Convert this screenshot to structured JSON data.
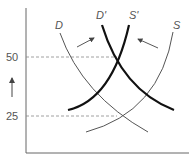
{
  "diagram": {
    "type": "supply-demand-shift",
    "y_ticks": [
      {
        "label": "50",
        "y": 57
      },
      {
        "label": "25",
        "y": 116
      }
    ],
    "curves": [
      {
        "name": "D",
        "label": "D",
        "weight": "thin",
        "path": "M60,33 Q82,95 148,132",
        "label_x": 55,
        "label_y": 29
      },
      {
        "name": "D-prime",
        "label": "D'",
        "weight": "thick",
        "path": "M102,25 Q122,90 174,110",
        "label_x": 96,
        "label_y": 19
      },
      {
        "name": "S-prime",
        "label": "S'",
        "weight": "thick",
        "path": "M129,25 Q112,100 68,110",
        "label_x": 129,
        "label_y": 19
      },
      {
        "name": "S",
        "label": "S",
        "weight": "thin",
        "path": "M173,32 Q160,112 86,132",
        "label_x": 173,
        "label_y": 29
      }
    ],
    "shift_arrows": [
      {
        "from": [
          77,
          47
        ],
        "to": [
          94,
          37
        ]
      },
      {
        "from": [
          158,
          48
        ],
        "to": [
          137,
          38
        ]
      }
    ],
    "price_arrow": {
      "from": [
        12,
        97
      ],
      "to": [
        12,
        77
      ]
    },
    "colors": {
      "thin": "#555555",
      "thick": "#111111",
      "dash": "#888888",
      "axis": "#666666"
    }
  }
}
